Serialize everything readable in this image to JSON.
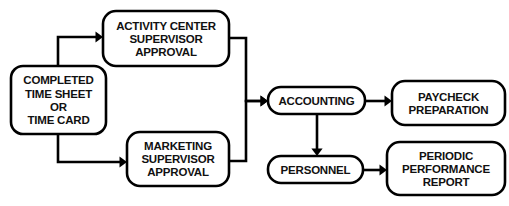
{
  "chart_data": {
    "type": "diagram",
    "orientation": "left-to-right",
    "canvas": {
      "width": 509,
      "height": 206
    },
    "style": {
      "node_shape": "rounded-rectangle",
      "node_fill": "#ffffff",
      "stroke_color": "#000000",
      "stroke_width": 2.6,
      "text_color": "#111111",
      "text_transform": "uppercase",
      "font_weight": "bold",
      "background": "#ffffff"
    },
    "nodes": [
      {
        "id": "source",
        "name": "completed-time-sheet-or-time-card",
        "lines": [
          "COMPLETED",
          "TIME SHEET",
          "OR",
          "TIME CARD"
        ],
        "x": 11,
        "y": 66,
        "w": 95,
        "h": 68,
        "r": 12
      },
      {
        "id": "activity",
        "name": "activity-center-supervisor-approval",
        "lines": [
          "ACTIVITY CENTER",
          "SUPERVISOR",
          "APPROVAL"
        ],
        "x": 103,
        "y": 11,
        "w": 126,
        "h": 55,
        "r": 13
      },
      {
        "id": "marketing",
        "name": "marketing-supervisor-approval",
        "lines": [
          "MARKETING",
          "SUPERVISOR",
          "APPROVAL"
        ],
        "x": 127,
        "y": 132,
        "w": 102,
        "h": 54,
        "r": 13
      },
      {
        "id": "accounting",
        "name": "accounting",
        "lines": [
          "ACCOUNTING"
        ],
        "x": 268,
        "y": 87,
        "w": 97,
        "h": 27,
        "r": 13
      },
      {
        "id": "paycheck",
        "name": "paycheck-preparation",
        "lines": [
          "PAYCHECK",
          "PREPARATION"
        ],
        "x": 392,
        "y": 81,
        "w": 113,
        "h": 44,
        "r": 13
      },
      {
        "id": "personnel",
        "name": "personnel",
        "lines": [
          "PERSONNEL"
        ],
        "x": 268,
        "y": 156,
        "w": 95,
        "h": 27,
        "r": 13
      },
      {
        "id": "report",
        "name": "periodic-performance-report",
        "lines": [
          "PERIODIC",
          "PERFORMANCE",
          "REPORT"
        ],
        "x": 387,
        "y": 142,
        "w": 118,
        "h": 53,
        "r": 13
      }
    ],
    "edges": [
      {
        "id": "e1",
        "name": "source-to-activity",
        "from": "source",
        "to": "activity",
        "path": "M 58 66 L 58 37 L 96 37",
        "arrow": {
          "x": 103,
          "y": 37,
          "dir": "right"
        }
      },
      {
        "id": "e2",
        "name": "source-to-marketing",
        "from": "source",
        "to": "marketing",
        "path": "M 58 134 L 58 162 L 120 162",
        "arrow": {
          "x": 127,
          "y": 162,
          "dir": "right"
        }
      },
      {
        "id": "e3",
        "name": "activity-to-accounting",
        "from": "activity",
        "to": "accounting",
        "path": "M 229 38 L 246 38 L 246 101 L 261 101",
        "arrow": {
          "x": 268,
          "y": 101,
          "dir": "right"
        }
      },
      {
        "id": "e4",
        "name": "marketing-to-accounting",
        "from": "marketing",
        "to": "accounting",
        "path": "M 229 161 L 246 161 L 246 101 L 261 101",
        "arrow": {
          "x": 268,
          "y": 101,
          "dir": "right"
        }
      },
      {
        "id": "e5",
        "name": "accounting-to-paycheck",
        "from": "accounting",
        "to": "paycheck",
        "path": "M 365 101 L 385 101",
        "arrow": {
          "x": 392,
          "y": 101,
          "dir": "right"
        }
      },
      {
        "id": "e6",
        "name": "accounting-to-personnel",
        "from": "accounting",
        "to": "personnel",
        "path": "M 317 114 L 317 149",
        "arrow": {
          "x": 317,
          "y": 156,
          "dir": "down"
        }
      },
      {
        "id": "e7",
        "name": "personnel-to-report",
        "from": "personnel",
        "to": "report",
        "path": "M 363 170 L 380 170",
        "arrow": {
          "x": 387,
          "y": 170,
          "dir": "right"
        }
      }
    ]
  }
}
